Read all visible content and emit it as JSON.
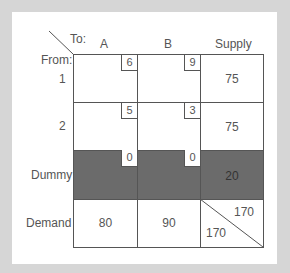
{
  "table": {
    "corner": {
      "to_label": "To:",
      "from_label": "From:"
    },
    "columns": [
      "A",
      "B",
      "Supply"
    ],
    "rows": [
      {
        "label": "1",
        "costs": [
          "6",
          "9"
        ],
        "supply": "75",
        "shaded": false
      },
      {
        "label": "2",
        "costs": [
          "5",
          "3"
        ],
        "supply": "75",
        "shaded": false
      },
      {
        "label": "Dummy",
        "costs": [
          "0",
          "0"
        ],
        "supply": "20",
        "shaded": true
      }
    ],
    "demand": {
      "label": "Demand",
      "values": [
        "80",
        "90"
      ],
      "total_supply": "170",
      "total_demand": "170"
    }
  },
  "colors": {
    "background": "#d6d6d6",
    "panel": "#ffffff",
    "shade": "#6b6b6b",
    "line": "#555555"
  }
}
